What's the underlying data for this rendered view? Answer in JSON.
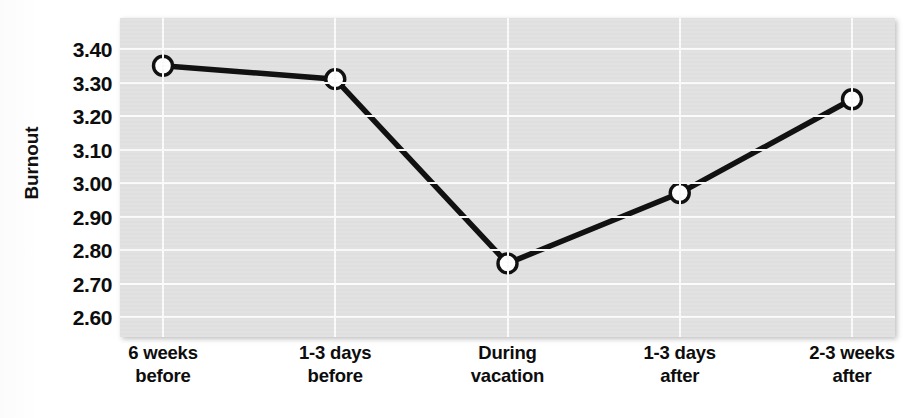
{
  "chart_data": {
    "type": "line",
    "title": "",
    "subtitle": "",
    "xlabel": "",
    "ylabel": "Burnout",
    "categories": [
      "6 weeks before",
      "1-3 days before",
      "During vacation",
      "1-3 days after",
      "2-3 weeks after"
    ],
    "category_lines": [
      [
        "6 weeks",
        "before"
      ],
      [
        "1-3 days",
        "before"
      ],
      [
        "During",
        "vacation"
      ],
      [
        "1-3 days",
        "after"
      ],
      [
        "2-3 weeks",
        "after"
      ]
    ],
    "values": [
      3.35,
      3.31,
      2.76,
      2.97,
      3.25
    ],
    "series": [
      {
        "name": "Burnout",
        "values": [
          3.35,
          3.31,
          2.76,
          2.97,
          3.25
        ],
        "marker": "open-circle",
        "line_color": "#111111",
        "marker_fill": "#ffffff"
      }
    ],
    "ylim": [
      2.55,
      3.45
    ],
    "yticks": [
      3.4,
      3.3,
      3.2,
      3.1,
      3.0,
      2.9,
      2.8,
      2.7,
      2.6
    ],
    "ytick_labels": [
      "3.40",
      "3.30",
      "3.20",
      "3.10",
      "3.00",
      "2.90",
      "2.80",
      "2.70",
      "2.60"
    ],
    "grid": true,
    "grid_color": "#fbfbfb",
    "plot_background": "#e2e2e2",
    "legend": null,
    "legend_position": "none",
    "annotations": []
  },
  "colors": {
    "line": "#111111",
    "marker_fill": "#ffffff",
    "marker_stroke": "#111111",
    "plot_bg": "#e2e2e2",
    "grid": "#fbfbfb",
    "text": "#0d0d0d",
    "page_bg": "#ffffff"
  }
}
